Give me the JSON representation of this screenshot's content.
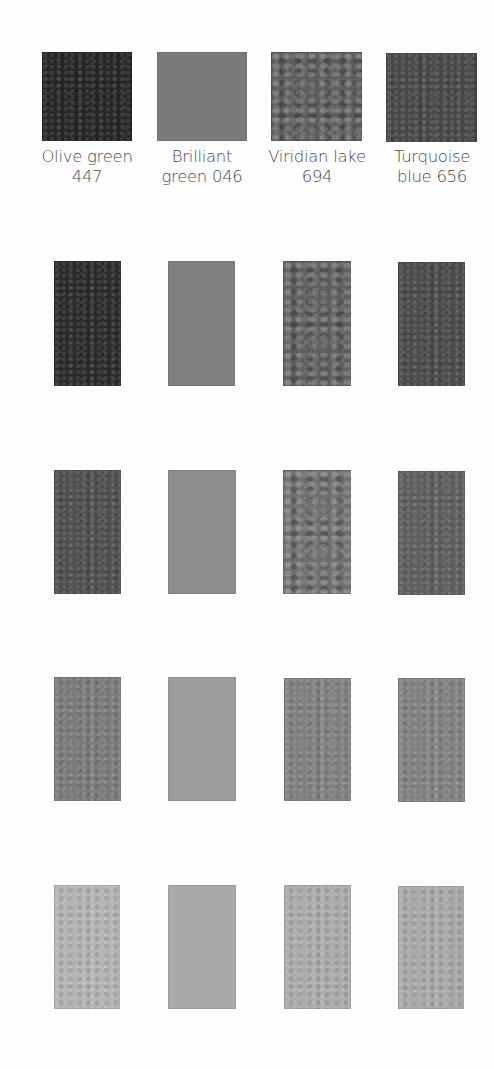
{
  "swatch_chart": {
    "columns": [
      {
        "name_line1": "Olive green",
        "name_line2": "447",
        "texture": "textured",
        "tints": [
          "#262626",
          "#2a2a2a",
          "#4f4f4f",
          "#7a7a7a",
          "#b4b4b4"
        ]
      },
      {
        "name_line1": "Brilliant",
        "name_line2": "green 046",
        "texture": "flat",
        "tints": [
          "#7a7a7a",
          "#808080",
          "#8d8d8d",
          "#9c9c9c",
          "#a9a9a9"
        ]
      },
      {
        "name_line1": "Viridian lake",
        "name_line2": "694",
        "texture": "mottled",
        "tints": [
          "#5c5c5c",
          "#5e5e5e",
          "#6e6e6e",
          "#818181",
          "#ababab"
        ]
      },
      {
        "name_line1": "Turquoise",
        "name_line2": "blue 656",
        "texture": "textured",
        "tints": [
          "#484848",
          "#4a4a4a",
          "#5e5e5e",
          "#828282",
          "#a8a8a8"
        ]
      }
    ]
  }
}
